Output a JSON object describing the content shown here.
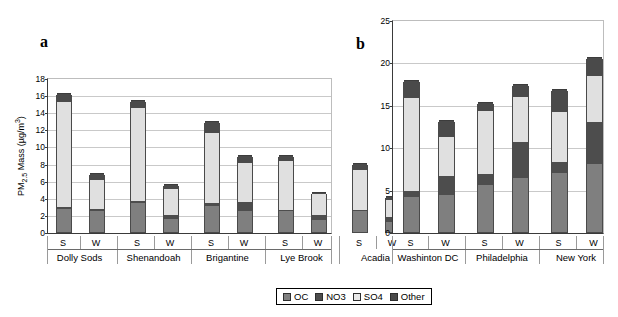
{
  "figure": {
    "panel_a_letter": "a",
    "panel_b_letter": "b"
  },
  "legend": {
    "items": [
      {
        "label": "OC",
        "color": "#7f7f7f"
      },
      {
        "label": "NO3",
        "color": "#4d4d4d"
      },
      {
        "label": "SO4",
        "color": "#e8e8e8"
      },
      {
        "label": "Other",
        "color": "#4a4a4a"
      }
    ]
  },
  "chart_data": [
    {
      "type": "bar",
      "panel": "a",
      "title": "",
      "stacked": true,
      "xlabel": "",
      "ylabel": "PM2.5 Mass (ug/m3)",
      "ylabel_parts": {
        "prefix": "PM",
        "sub": "2.5",
        "mid": " Mass (µg/m",
        "sup": "3",
        "suffix": ")"
      },
      "ylim": [
        0,
        18
      ],
      "yticks": [
        0,
        2,
        4,
        6,
        8,
        10,
        12,
        14,
        16,
        18
      ],
      "grid": true,
      "legend_position": "bottom-center",
      "categories": [
        "Dolly Sods",
        "Shenandoah",
        "Brigantine",
        "Lye Brook",
        "Acadia"
      ],
      "seasons": [
        "S",
        "W"
      ],
      "series": [
        {
          "name": "OC",
          "values": [
            2.7,
            2.4,
            3.4,
            1.55,
            3.0,
            2.45,
            2.4,
            1.35,
            2.45,
            1.15
          ]
        },
        {
          "name": "NO3",
          "values": [
            0.2,
            0.3,
            0.2,
            0.4,
            0.4,
            1.1,
            0.15,
            0.65,
            0.15,
            0.55
          ]
        },
        {
          "name": "SO4",
          "values": [
            12.3,
            3.4,
            10.9,
            3.1,
            8.2,
            4.5,
            5.75,
            2.4,
            4.7,
            2.0
          ]
        },
        {
          "name": "Other",
          "values": [
            0.9,
            0.7,
            0.8,
            0.5,
            1.3,
            0.85,
            0.6,
            0.2,
            0.6,
            0.45
          ]
        }
      ],
      "bar_totals": [
        16.1,
        6.8,
        15.3,
        5.55,
        12.9,
        8.9,
        8.9,
        4.6,
        7.9,
        4.15
      ]
    },
    {
      "type": "bar",
      "panel": "b",
      "title": "",
      "stacked": true,
      "xlabel": "",
      "ylabel": "",
      "ylim": [
        0,
        25
      ],
      "yticks": [
        0,
        5,
        10,
        15,
        20,
        25
      ],
      "grid": true,
      "legend_position": "bottom-center",
      "categories": [
        "Washinton DC",
        "Philadelphia",
        "New York"
      ],
      "seasons": [
        "S",
        "W"
      ],
      "series": [
        {
          "name": "OC",
          "values": [
            4.1,
            4.35,
            5.6,
            6.35,
            6.95,
            8.05
          ]
        },
        {
          "name": "NO3",
          "values": [
            0.7,
            2.25,
            1.3,
            4.3,
            1.35,
            4.9
          ]
        },
        {
          "name": "SO4",
          "values": [
            11.0,
            4.6,
            7.4,
            5.25,
            5.85,
            5.45
          ]
        },
        {
          "name": "Other",
          "values": [
            2.0,
            1.9,
            0.9,
            1.4,
            2.65,
            2.15
          ]
        }
      ],
      "bar_totals": [
        17.8,
        13.1,
        15.2,
        17.3,
        16.8,
        20.55
      ]
    }
  ]
}
